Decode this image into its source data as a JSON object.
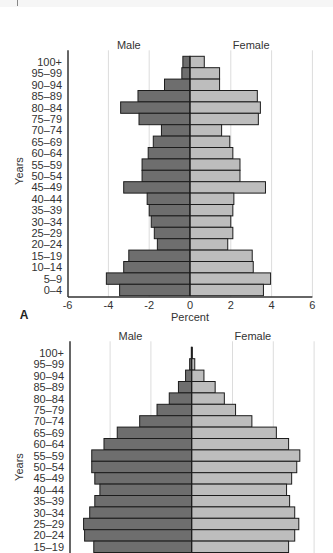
{
  "colors": {
    "male": "#6e6e6e",
    "female": "#bdbdbd",
    "border": "#1c1c1c",
    "grid": "#dcdcdc",
    "axis": "#333333"
  },
  "chart_data": [
    {
      "type": "bar",
      "orientation": "horizontal-population-pyramid",
      "panel_label": "A",
      "title": "",
      "header_left": "Male",
      "header_right": "Female",
      "xlabel": "Percent",
      "ylabel": "Years",
      "xlim": [
        -6,
        6
      ],
      "xticks": [
        -6,
        -4,
        -2,
        0,
        2,
        4,
        6
      ],
      "grid": true,
      "categories": [
        "100+",
        "95–99",
        "90–94",
        "85–89",
        "80–84",
        "75–79",
        "70–74",
        "65–69",
        "60–64",
        "55–59",
        "50–54",
        "45–49",
        "40–44",
        "35–39",
        "30–34",
        "25–29",
        "20–24",
        "15–19",
        "10–14",
        "5–9",
        "0–4"
      ],
      "series": [
        {
          "name": "Male",
          "values": [
            -0.35,
            -0.4,
            -1.25,
            -2.55,
            -3.4,
            -2.5,
            -1.4,
            -1.8,
            -2.05,
            -2.35,
            -2.35,
            -3.25,
            -2.1,
            -2.0,
            -1.9,
            -1.75,
            -1.6,
            -3.0,
            -3.25,
            -4.1,
            -3.45
          ]
        },
        {
          "name": "Female",
          "values": [
            0.7,
            1.45,
            1.45,
            3.3,
            3.45,
            3.35,
            1.55,
            1.95,
            2.1,
            2.45,
            2.45,
            3.7,
            2.15,
            2.1,
            2.0,
            2.1,
            1.85,
            3.05,
            3.1,
            3.95,
            3.6
          ]
        }
      ]
    },
    {
      "type": "bar",
      "orientation": "horizontal-population-pyramid",
      "panel_label": "B",
      "title": "",
      "header_left": "Male",
      "header_right": "Female",
      "xlabel": "Percent",
      "ylabel": "Years",
      "xlim": [
        -6,
        6
      ],
      "xticks": [
        -6,
        -4,
        -2,
        0,
        2,
        4,
        6
      ],
      "grid": true,
      "categories": [
        "100+",
        "95–99",
        "90–94",
        "85–89",
        "80–84",
        "75–79",
        "70–74",
        "65–69",
        "60–64",
        "55–59",
        "50–54",
        "45–49",
        "40–44",
        "35–39",
        "30–34",
        "25–29",
        "20–24",
        "15–19"
      ],
      "series": [
        {
          "name": "Male",
          "values": [
            -0.02,
            -0.1,
            -0.3,
            -0.65,
            -1.1,
            -1.7,
            -2.55,
            -3.65,
            -4.3,
            -4.9,
            -4.9,
            -4.75,
            -4.5,
            -4.75,
            -5.0,
            -5.3,
            -5.25,
            -4.8
          ]
        },
        {
          "name": "Female",
          "values": [
            0.03,
            0.15,
            0.6,
            1.15,
            1.6,
            2.15,
            2.95,
            4.15,
            4.75,
            5.3,
            5.15,
            4.9,
            4.65,
            4.8,
            5.05,
            5.25,
            5.05,
            4.75
          ]
        }
      ]
    }
  ],
  "layout": {
    "panels": [
      {
        "axis_x": 68,
        "zero_x": 190,
        "px_per_unit": 20.4,
        "first_row_y": 62,
        "row_pitch": 11.4,
        "header_y": 49,
        "show_x_axis": true,
        "axis_y": 297
      },
      {
        "axis_x": 70,
        "zero_x": 191.7,
        "px_per_unit": 20.4,
        "first_row_y": 353,
        "row_pitch": 11.4,
        "header_y": 340,
        "show_x_axis": false,
        "axis_y": 560
      }
    ]
  }
}
